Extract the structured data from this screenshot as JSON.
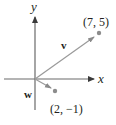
{
  "diagram": {
    "axes": {
      "x_label": "x",
      "y_label": "y",
      "axis_color": "#5a5a5a"
    },
    "vectors": [
      {
        "name": "v",
        "label": "v",
        "tip_label": "(7, 5)",
        "components": [
          7,
          5
        ],
        "color": "#9a9a9a"
      },
      {
        "name": "w",
        "label": "w",
        "tip_label": "(2, −1)",
        "components": [
          2,
          -1
        ],
        "color": "#9a9a9a"
      }
    ],
    "point_color": "#8c8c8c",
    "text_color": "#231f20"
  }
}
